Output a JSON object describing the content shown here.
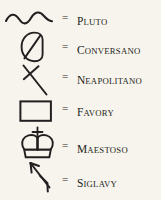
{
  "legend": {
    "background_color": "#f7f4ed",
    "ink_color": "#231f20",
    "equals_sign": "=",
    "rows": [
      {
        "id": "pluto",
        "symbol_name": "wavy-line-symbol",
        "symbol_description": "horizontal wavy line",
        "label_initial": "P",
        "label_rest": "LUTO",
        "label_full": "Pluto"
      },
      {
        "id": "conversano",
        "symbol_name": "slashed-oval-symbol",
        "symbol_description": "oval with diagonal slash",
        "label_initial": "C",
        "label_rest": "ONVERSANO",
        "label_full": "Conversano"
      },
      {
        "id": "neapolitano",
        "symbol_name": "crossed-diagonal-symbol",
        "symbol_description": "long diagonal stroke crossed near top",
        "label_initial": "N",
        "label_rest": "EAPOLITANO",
        "label_full": "Neapolitano"
      },
      {
        "id": "favory",
        "symbol_name": "rectangle-symbol",
        "symbol_description": "open rectangle outline",
        "label_initial": "F",
        "label_rest": "AVORY",
        "label_full": "Favory"
      },
      {
        "id": "maestoso",
        "symbol_name": "crown-symbol",
        "symbol_description": "crown with cross finial",
        "label_initial": "M",
        "label_rest": "AESTOSO",
        "label_full": "Maestoso"
      },
      {
        "id": "siglavy",
        "symbol_name": "barbed-arrow-symbol",
        "symbol_description": "arrow pointing up-left with barb",
        "label_initial": "S",
        "label_rest": "IGLAVY",
        "label_full": "Siglavy"
      }
    ]
  }
}
